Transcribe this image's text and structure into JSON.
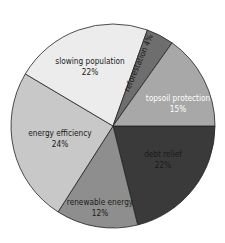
{
  "chart_data": {
    "type": "pie",
    "title": "",
    "categories": [
      "topsoil protection",
      "debt relief",
      "renewable energy",
      "energy efficiency",
      "slowing population",
      "reforestation"
    ],
    "values": [
      15,
      22,
      12,
      24,
      22,
      4
    ],
    "value_labels": [
      "15%",
      "22%",
      "12%",
      "24%",
      "22%",
      "4%"
    ],
    "colors": [
      "#3a3a3a",
      "#8e8e8e",
      "#c8c8c8",
      "#ececec",
      "#6e6e6e",
      "#a8a8a8"
    ],
    "label_colors": [
      "#ffffff",
      "#1a1a1a",
      "#1a1a1a",
      "#1a1a1a",
      "#1a1a1a",
      "#1a1a1a"
    ],
    "legend": "none (labels inside slices)",
    "boundary_angles_deg": [
      0,
      76,
      122.6,
      210.7,
      289.7,
      305.4,
      360
    ]
  },
  "slices": [
    {
      "name": "topsoil protection",
      "pct": "15%"
    },
    {
      "name": "debt relief",
      "pct": "22%"
    },
    {
      "name": "renewable energy",
      "pct": "12%"
    },
    {
      "name": "energy efficiency",
      "pct": "24%"
    },
    {
      "name": "slowing population",
      "pct": "22%"
    },
    {
      "name": "reforestation",
      "pct": "4%",
      "combined": "reforestation 4%"
    }
  ]
}
